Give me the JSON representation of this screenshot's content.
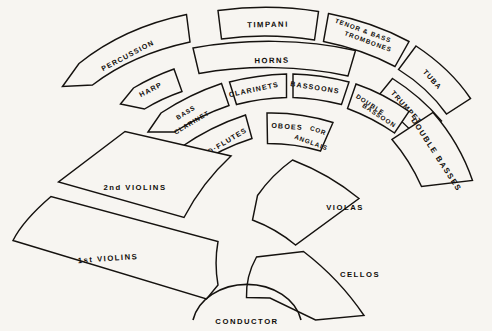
{
  "diagram": {
    "background_color": "#f7f5f1",
    "line_color": "#15120f",
    "podium": {
      "label": "CONDUCTOR",
      "name": "conductor-podium"
    },
    "sections": [
      {
        "id": "percussion",
        "label": "PERCUSSION",
        "ring": "back",
        "family": "percussion"
      },
      {
        "id": "timpani",
        "label": "TIMPANI",
        "ring": "back",
        "family": "percussion"
      },
      {
        "id": "tenor-bass-trombones",
        "label": "TENOR & BASS\nTROMBONES",
        "lines": [
          "TENOR & BASS",
          "TROMBONES"
        ],
        "ring": "back",
        "family": "brass"
      },
      {
        "id": "tuba",
        "label": "TUBA",
        "ring": "back",
        "family": "brass"
      },
      {
        "id": "harp",
        "label": "HARP",
        "ring": "middle",
        "family": "strings"
      },
      {
        "id": "horns",
        "label": "HORNS",
        "ring": "middle",
        "family": "brass"
      },
      {
        "id": "trumpets",
        "label": "TRUMPETS",
        "ring": "middle",
        "family": "brass"
      },
      {
        "id": "bass-clarinet",
        "label": "BASS\nCLARINET",
        "lines": [
          "BASS",
          "CLARINET"
        ],
        "ring": "woodwind-back",
        "family": "woodwind"
      },
      {
        "id": "clarinets",
        "label": "CLARINETS",
        "ring": "woodwind-back",
        "family": "woodwind"
      },
      {
        "id": "bassoons",
        "label": "BASSOONS",
        "ring": "woodwind-back",
        "family": "woodwind"
      },
      {
        "id": "double-bassoon",
        "label": "DOUBLE\nBASSOON",
        "lines": [
          "DOUBLE",
          "BASSOON"
        ],
        "ring": "woodwind-back",
        "family": "woodwind"
      },
      {
        "id": "piccolo-flutes",
        "label": "PICCOLO·FLUTES",
        "ring": "woodwind-front",
        "family": "woodwind"
      },
      {
        "id": "oboes",
        "label": "OBOES",
        "ring": "woodwind-front",
        "family": "woodwind"
      },
      {
        "id": "cor-anglais",
        "label": "COR\nANGLAIS",
        "lines": [
          "COR",
          "ANGLAIS"
        ],
        "ring": "woodwind-front",
        "family": "woodwind"
      },
      {
        "id": "double-basses",
        "label": "DOUBLE BASSES",
        "ring": "outer",
        "family": "strings"
      },
      {
        "id": "second-violins",
        "label": "2nd VIOLINS",
        "ring": "front",
        "family": "strings"
      },
      {
        "id": "first-violins",
        "label": "1st VIOLINS",
        "ring": "front",
        "family": "strings"
      },
      {
        "id": "violas",
        "label": "VIOLAS",
        "ring": "front",
        "family": "strings"
      },
      {
        "id": "cellos",
        "label": "CELLOS",
        "ring": "front",
        "family": "strings"
      }
    ]
  }
}
